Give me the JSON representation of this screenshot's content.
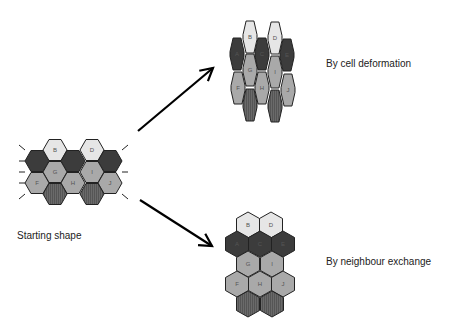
{
  "labels": {
    "start": "Starting shape",
    "deformation": "By cell deformation",
    "exchange": "By neighbour exchange"
  },
  "colors": {
    "light": "#e6e6e6",
    "mid": "#a9a9a9",
    "dark": "#3c3c3c",
    "striped": "#666666",
    "outline": "#222222"
  },
  "cells": {
    "start": [
      {
        "id": "A",
        "label": "",
        "shade": "dark",
        "x": 37,
        "y": 161
      },
      {
        "id": "B",
        "label": "B",
        "shade": "light",
        "x": 55,
        "y": 150
      },
      {
        "id": "C",
        "label": "",
        "shade": "dark",
        "x": 73,
        "y": 161
      },
      {
        "id": "D",
        "label": "D",
        "shade": "light",
        "x": 92,
        "y": 150
      },
      {
        "id": "E",
        "label": "",
        "shade": "dark",
        "x": 110,
        "y": 161
      },
      {
        "id": "G",
        "label": "G",
        "shade": "mid",
        "x": 55,
        "y": 172
      },
      {
        "id": "I",
        "label": "I",
        "shade": "mid",
        "x": 92,
        "y": 172
      },
      {
        "id": "F",
        "label": "F",
        "shade": "mid",
        "x": 37,
        "y": 183
      },
      {
        "id": "H",
        "label": "H",
        "shade": "mid",
        "x": 73,
        "y": 183
      },
      {
        "id": "J",
        "label": "J",
        "shade": "mid",
        "x": 110,
        "y": 183
      },
      {
        "id": "K",
        "label": "",
        "shade": "striped",
        "x": 55,
        "y": 194
      },
      {
        "id": "L",
        "label": "",
        "shade": "striped",
        "x": 92,
        "y": 194
      }
    ],
    "deformation": [
      {
        "id": "A",
        "label": "A",
        "shade": "dark",
        "x": 237,
        "y": 54
      },
      {
        "id": "B",
        "label": "B",
        "shade": "light",
        "x": 250,
        "y": 37
      },
      {
        "id": "C",
        "label": "C",
        "shade": "dark",
        "x": 262,
        "y": 54
      },
      {
        "id": "D",
        "label": "D",
        "shade": "light",
        "x": 275,
        "y": 38
      },
      {
        "id": "E",
        "label": "E",
        "shade": "dark",
        "x": 287,
        "y": 55
      },
      {
        "id": "G",
        "label": "G",
        "shade": "mid",
        "x": 250,
        "y": 70
      },
      {
        "id": "I",
        "label": "I",
        "shade": "mid",
        "x": 275,
        "y": 72
      },
      {
        "id": "F",
        "label": "F",
        "shade": "mid",
        "x": 238,
        "y": 88
      },
      {
        "id": "H",
        "label": "H",
        "shade": "mid",
        "x": 262,
        "y": 88
      },
      {
        "id": "J",
        "label": "J",
        "shade": "mid",
        "x": 288,
        "y": 90
      },
      {
        "id": "K",
        "label": "",
        "shade": "striped",
        "x": 250,
        "y": 105
      },
      {
        "id": "L",
        "label": "",
        "shade": "striped",
        "x": 275,
        "y": 106
      }
    ],
    "exchange": [
      {
        "id": "B",
        "label": "B",
        "shade": "light",
        "x": 248,
        "y": 225
      },
      {
        "id": "D",
        "label": "D",
        "shade": "light",
        "x": 271,
        "y": 225
      },
      {
        "id": "A",
        "label": "A",
        "shade": "dark",
        "x": 237,
        "y": 244
      },
      {
        "id": "C",
        "label": "C",
        "shade": "dark",
        "x": 260,
        "y": 244
      },
      {
        "id": "E",
        "label": "E",
        "shade": "dark",
        "x": 283,
        "y": 244
      },
      {
        "id": "G",
        "label": "G",
        "shade": "mid",
        "x": 248,
        "y": 264
      },
      {
        "id": "I",
        "label": "I",
        "shade": "mid",
        "x": 272,
        "y": 264
      },
      {
        "id": "F",
        "label": "F",
        "shade": "mid",
        "x": 237,
        "y": 284
      },
      {
        "id": "H",
        "label": "H",
        "shade": "mid",
        "x": 260,
        "y": 284
      },
      {
        "id": "J",
        "label": "J",
        "shade": "mid",
        "x": 283,
        "y": 284
      },
      {
        "id": "K",
        "label": "",
        "shade": "striped",
        "x": 248,
        "y": 304
      },
      {
        "id": "L",
        "label": "",
        "shade": "striped",
        "x": 272,
        "y": 304
      }
    ]
  },
  "arrows": [
    {
      "from": [
        138,
        131
      ],
      "to": [
        213,
        68
      ]
    },
    {
      "from": [
        140,
        200
      ],
      "to": [
        212,
        246
      ]
    }
  ]
}
